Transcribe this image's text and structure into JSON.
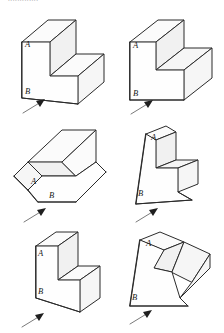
{
  "page": {
    "background_color": "#ffffff",
    "line_color": "#2b2b2b",
    "face_color": "#fefefe",
    "arrow_tail_color": "#7a7a7a",
    "arrow_head_color": "#1f1f1f",
    "header_sliver_text": "............."
  },
  "figures": [
    {
      "id": "figure-1",
      "position": "top-left",
      "label_a": "A",
      "label_b": "B",
      "arrow_direction": "up-right",
      "description": "L-shaped step block, front face toward lower-left, notch at top-center"
    },
    {
      "id": "figure-2",
      "position": "top-right",
      "label_a": "A",
      "label_b": "B",
      "arrow_direction": "up-right",
      "description": "Step block with flat square front face and recessed channel across the top"
    },
    {
      "id": "figure-3",
      "position": "middle-left",
      "label_a": "A",
      "label_b": "B",
      "arrow_direction": "up-right",
      "description": "Step block viewed from above, long ridge running to upper-right"
    },
    {
      "id": "figure-4",
      "position": "middle-right",
      "label_a": "A",
      "label_b": "B",
      "arrow_direction": "up-right",
      "description": "Tall step block tilted with notch cut into the upper-right side"
    },
    {
      "id": "figure-5",
      "position": "bottom-left",
      "label_a": "A",
      "label_b": "B",
      "arrow_direction": "up-right",
      "description": "Narrow upright step block with single step on the right"
    },
    {
      "id": "figure-6",
      "position": "bottom-right",
      "label_a": "A",
      "label_b": "B",
      "arrow_direction": "up-right",
      "description": "Leaning step block with wedge notch opening to the right"
    }
  ]
}
